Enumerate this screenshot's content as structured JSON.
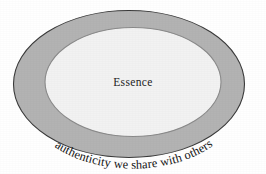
{
  "figure": {
    "type": "concentric-ellipse-diagram",
    "background_color": "#ffffff",
    "outer_ring": {
      "label": "authenticity we share with others",
      "fill_color": "#b3b3b3",
      "stroke_color": "#3a3a3a",
      "center_x": 129,
      "center_y": 84,
      "radius_x": 116,
      "radius_y": 74
    },
    "inner_ellipse": {
      "label": "Essence",
      "fill_color": "#f2f2f2",
      "stroke_color": "#8a8a8a",
      "center_x": 133,
      "center_y": 82,
      "radius_x": 88,
      "radius_y": 55
    },
    "text_color": "#141414"
  }
}
